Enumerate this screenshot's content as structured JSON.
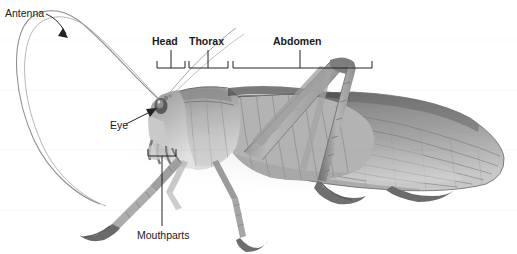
{
  "figure": {
    "kind": "labeled-photograph",
    "width": 517,
    "height": 254,
    "background_color": "#ffffff",
    "label_color": "#1a1a1a",
    "line_color": "#222222"
  },
  "labels": {
    "antenna": "Antenna",
    "head": "Head",
    "thorax": "Thorax",
    "abdomen": "Abdomen",
    "eye": "Eye",
    "mouthparts": "Mouthparts"
  },
  "annotations": [
    {
      "name": "antenna",
      "text": "Antenna",
      "style": "plain",
      "pointer": "curved-arrow",
      "x": 5,
      "y": 8
    },
    {
      "name": "eye",
      "text": "Eye",
      "style": "plain",
      "pointer": "straight-arrow",
      "x": 110,
      "y": 120
    },
    {
      "name": "mouthparts",
      "text": "Mouthparts",
      "style": "plain",
      "pointer": "bracket-up-with-stem",
      "x": 137,
      "y": 230
    },
    {
      "name": "head",
      "text": "Head",
      "style": "bold",
      "pointer": "bracket-down-with-stem",
      "x": 152,
      "y": 36
    },
    {
      "name": "thorax",
      "text": "Thorax",
      "style": "bold",
      "pointer": "bracket-down-with-stem",
      "x": 189,
      "y": 36
    },
    {
      "name": "abdomen",
      "text": "Abdomen",
      "style": "bold",
      "pointer": "bracket-down-with-stem",
      "x": 273,
      "y": 36
    }
  ],
  "brackets": {
    "head": {
      "left": 157,
      "right": 185,
      "baseline": 68,
      "stem_top": 50,
      "stem_x": 171
    },
    "thorax": {
      "left": 189,
      "right": 228,
      "baseline": 68,
      "stem_top": 50,
      "stem_x": 208
    },
    "abdomen": {
      "left": 233,
      "right": 372,
      "baseline": 68,
      "stem_top": 50,
      "stem_x": 300
    },
    "mouthparts": {
      "left": 148,
      "right": 176,
      "baseline": 156,
      "stem_bottom": 226,
      "stem_x": 162
    }
  }
}
